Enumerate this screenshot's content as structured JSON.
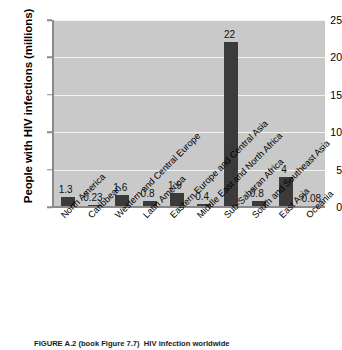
{
  "chart_data": {
    "type": "bar",
    "title": "",
    "xlabel": "",
    "ylabel": "People with HIV infections (millions)",
    "ylim": [
      0,
      25
    ],
    "yticks": [
      0,
      5,
      10,
      15,
      20,
      25
    ],
    "grid": true,
    "legend": "none",
    "bar_color": "#3b3b3b",
    "plot_background": "#c9c9c9",
    "categories": [
      "North America",
      "Caribbean",
      "Western and Central Europe",
      "Latin America",
      "Eastern Europe and Central Asia",
      "Middle East and North Africa",
      "Sub-Saharan Africa",
      "South and Southeast Asia",
      "East Asia",
      "Oceania"
    ],
    "values": [
      1.3,
      0.23,
      1.6,
      0.8,
      1.9,
      0.4,
      22,
      0.8,
      4,
      0.08
    ],
    "value_labels": [
      "1.3",
      "0.23",
      "1.6",
      "0.8",
      "1.9",
      "0.4",
      "22",
      "0.8",
      "4",
      "0.08"
    ]
  },
  "caption": {
    "figure_number": "FIGURE A.2 (book Figure 7.7)",
    "text": "HIV infection worldwide",
    "full": "FIGURE A.2 (book Figure 7.7)  HIV infection worldwide"
  }
}
